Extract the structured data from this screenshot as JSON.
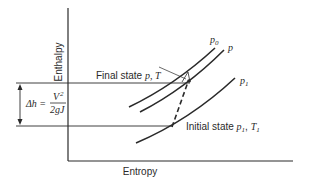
{
  "axes": {
    "x_label": "Entropy",
    "y_label": "Enthalpy"
  },
  "curves": [
    {
      "id": "p0",
      "label_main": "p",
      "label_sub": "0"
    },
    {
      "id": "p",
      "label_main": "p",
      "label_sub": ""
    },
    {
      "id": "p1",
      "label_main": "p",
      "label_sub": "1"
    }
  ],
  "annotations": {
    "final_state_text": "Final state ",
    "final_state_vars": "p, T",
    "initial_state_text": "Initial state ",
    "initial_state_p": "p",
    "initial_state_p_sub": "1",
    "initial_state_sep": ", ",
    "initial_state_T": "T",
    "initial_state_T_sub": "1"
  },
  "delta_h": {
    "lhs": "Δh =",
    "numerator": "V",
    "numerator_sup": "2",
    "denominator": "2gJ"
  },
  "colors": {
    "line": "#2a2a2a",
    "background": "#ffffff"
  }
}
